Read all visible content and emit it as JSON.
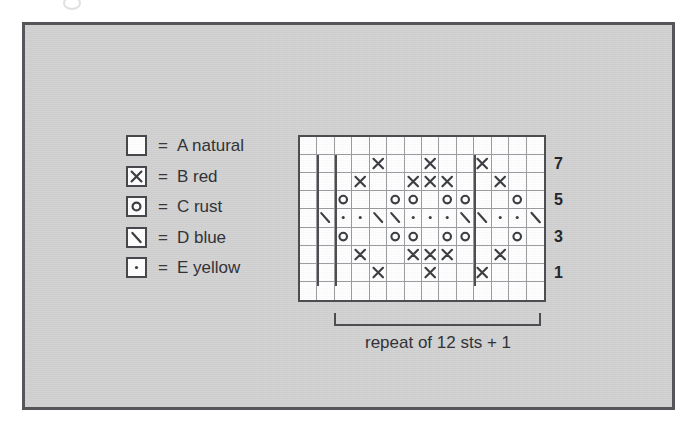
{
  "figure": {
    "caption": "repeat of 12 sts + 1"
  },
  "legend": {
    "equals": "=",
    "items": [
      {
        "symbol": "blank",
        "symbol_name": "empty-square-symbol",
        "label": "A natural"
      },
      {
        "symbol": "cross",
        "symbol_name": "cross-symbol",
        "label": "B red"
      },
      {
        "symbol": "circle",
        "symbol_name": "circle-symbol",
        "label": "C rust"
      },
      {
        "symbol": "slash",
        "symbol_name": "slash-symbol",
        "label": "D blue"
      },
      {
        "symbol": "dot",
        "symbol_name": "dot-symbol",
        "label": "E yellow"
      }
    ]
  },
  "chart_data": {
    "type": "table",
    "columns": 14,
    "rows": 9,
    "row_labels": [
      "1",
      "",
      "3",
      "",
      "5",
      "",
      "7",
      "",
      ""
    ],
    "visible_row_numbers": [
      {
        "row": 1,
        "label": "1"
      },
      {
        "row": 3,
        "label": "3"
      },
      {
        "row": 5,
        "label": "5"
      },
      {
        "row": 7,
        "label": "7"
      }
    ],
    "symbol_key": {
      "blank": "A natural",
      "cross": "B red",
      "circle": "C rust",
      "slash": "D blue",
      "dot": "E yellow"
    },
    "repeat_boundaries_after_column": [
      1,
      2,
      10
    ],
    "cells": [
      [
        "blank",
        "blank",
        "blank",
        "blank",
        "blank",
        "blank",
        "blank",
        "blank",
        "blank",
        "blank",
        "blank",
        "blank",
        "blank",
        "blank"
      ],
      [
        "blank",
        "blank",
        "blank",
        "blank",
        "cross",
        "blank",
        "blank",
        "cross",
        "blank",
        "blank",
        "cross",
        "blank",
        "blank",
        "blank"
      ],
      [
        "blank",
        "blank",
        "blank",
        "cross",
        "blank",
        "blank",
        "cross",
        "cross",
        "cross",
        "blank",
        "blank",
        "cross",
        "blank",
        "blank"
      ],
      [
        "blank",
        "blank",
        "circle",
        "blank",
        "blank",
        "circle",
        "circle",
        "blank",
        "circle",
        "circle",
        "blank",
        "blank",
        "circle",
        "blank"
      ],
      [
        "blank",
        "slash",
        "dot",
        "dot",
        "slash",
        "slash",
        "dot",
        "dot",
        "dot",
        "slash",
        "slash",
        "dot",
        "dot",
        "slash"
      ],
      [
        "blank",
        "blank",
        "circle",
        "blank",
        "blank",
        "circle",
        "circle",
        "blank",
        "circle",
        "circle",
        "blank",
        "blank",
        "circle",
        "blank"
      ],
      [
        "blank",
        "blank",
        "blank",
        "cross",
        "blank",
        "blank",
        "cross",
        "cross",
        "cross",
        "blank",
        "blank",
        "cross",
        "blank",
        "blank"
      ],
      [
        "blank",
        "blank",
        "blank",
        "blank",
        "cross",
        "blank",
        "blank",
        "cross",
        "blank",
        "blank",
        "cross",
        "blank",
        "blank",
        "blank"
      ],
      [
        "blank",
        "blank",
        "blank",
        "blank",
        "blank",
        "blank",
        "blank",
        "blank",
        "blank",
        "blank",
        "blank",
        "blank",
        "blank",
        "blank"
      ]
    ]
  },
  "colors": {
    "panel_background": "#d2d2d2",
    "frame": "#55565a",
    "grid_line": "#9a9ca0",
    "grid_border": "#4a4c50",
    "symbol_ink": "#3a3c40",
    "text": "#2f3135",
    "chart_background": "#ffffff"
  }
}
